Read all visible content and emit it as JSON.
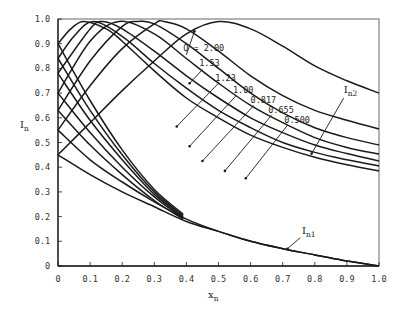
{
  "chart_data": {
    "type": "line",
    "title": "",
    "xlabel": "x_n",
    "ylabel": "I_n",
    "xlim": [
      0,
      1.0
    ],
    "ylim": [
      0,
      1.0
    ],
    "grid": false,
    "x_ticks": [
      "0",
      "0.1",
      "0.2",
      "0.3",
      "0.4",
      "0.5",
      "0.6",
      "0.7",
      "0.8",
      "0.9",
      "1.0"
    ],
    "y_ticks": [
      "0",
      "0.1",
      "0.2",
      "0.3",
      "0.4",
      "0.5",
      "0.6",
      "0.7",
      "0.8",
      "0.9",
      "1.0"
    ],
    "annotations": [
      {
        "text": "Q = 2.00",
        "x": 0.39,
        "y": 0.87
      },
      {
        "text": "1.53",
        "x": 0.44,
        "y": 0.81
      },
      {
        "text": "1.23",
        "x": 0.49,
        "y": 0.75
      },
      {
        "text": "1.00",
        "x": 0.545,
        "y": 0.7
      },
      {
        "text": "0.817",
        "x": 0.6,
        "y": 0.66
      },
      {
        "text": "0.655",
        "x": 0.655,
        "y": 0.62
      },
      {
        "text": "0.500",
        "x": 0.705,
        "y": 0.58
      },
      {
        "text": "I_n2",
        "x": 0.89,
        "y": 0.7
      },
      {
        "text": "I_n1",
        "x": 0.76,
        "y": 0.13
      }
    ],
    "series_In2": [
      {
        "name": "Q = 2.00",
        "x": [
          0,
          0.1,
          0.2,
          0.3,
          0.4,
          0.5,
          0.6,
          0.7,
          0.8,
          0.9,
          1.0
        ],
        "y": [
          0.45,
          0.58,
          0.71,
          0.83,
          0.94,
          0.99,
          0.96,
          0.89,
          0.81,
          0.75,
          0.7
        ]
      },
      {
        "name": "Q = 1.53",
        "x": [
          0,
          0.1,
          0.2,
          0.3,
          0.33,
          0.4,
          0.5,
          0.6,
          0.7,
          0.8,
          0.9,
          1.0
        ],
        "y": [
          0.55,
          0.73,
          0.88,
          0.98,
          0.99,
          0.96,
          0.87,
          0.77,
          0.69,
          0.63,
          0.59,
          0.555
        ]
      },
      {
        "name": "Q = 1.23",
        "x": [
          0,
          0.1,
          0.2,
          0.25,
          0.3,
          0.4,
          0.5,
          0.6,
          0.7,
          0.8,
          0.9,
          1.0
        ],
        "y": [
          0.63,
          0.83,
          0.97,
          0.99,
          0.98,
          0.9,
          0.8,
          0.7,
          0.62,
          0.56,
          0.52,
          0.49
        ]
      },
      {
        "name": "Q = 1.00",
        "x": [
          0,
          0.1,
          0.19,
          0.3,
          0.4,
          0.5,
          0.6,
          0.7,
          0.8,
          0.9,
          1.0
        ],
        "y": [
          0.7,
          0.91,
          0.99,
          0.94,
          0.84,
          0.74,
          0.65,
          0.58,
          0.52,
          0.48,
          0.453
        ]
      },
      {
        "name": "Q = 0.817",
        "x": [
          0,
          0.1,
          0.14,
          0.2,
          0.3,
          0.4,
          0.5,
          0.6,
          0.7,
          0.8,
          0.9,
          1.0
        ],
        "y": [
          0.78,
          0.96,
          0.99,
          0.96,
          0.87,
          0.77,
          0.68,
          0.6,
          0.54,
          0.49,
          0.455,
          0.425
        ]
      },
      {
        "name": "Q = 0.655",
        "x": [
          0,
          0.05,
          0.11,
          0.2,
          0.3,
          0.4,
          0.5,
          0.6,
          0.7,
          0.8,
          0.9,
          1.0
        ],
        "y": [
          0.84,
          0.93,
          0.99,
          0.93,
          0.82,
          0.72,
          0.63,
          0.56,
          0.5,
          0.46,
          0.43,
          0.405
        ]
      },
      {
        "name": "Q = 0.500",
        "x": [
          0,
          0.04,
          0.08,
          0.15,
          0.2,
          0.3,
          0.4,
          0.5,
          0.6,
          0.7,
          0.8,
          0.9,
          1.0
        ],
        "y": [
          0.9,
          0.96,
          0.99,
          0.96,
          0.91,
          0.79,
          0.68,
          0.6,
          0.53,
          0.48,
          0.44,
          0.41,
          0.385
        ]
      }
    ],
    "series_In1": [
      {
        "name": "Q = 0.500",
        "x": [
          0,
          0.1,
          0.2,
          0.3,
          0.39
        ],
        "y": [
          0.9,
          0.67,
          0.47,
          0.31,
          0.21
        ]
      },
      {
        "name": "Q = 0.655",
        "x": [
          0,
          0.1,
          0.2,
          0.3,
          0.39
        ],
        "y": [
          0.84,
          0.63,
          0.45,
          0.3,
          0.205
        ]
      },
      {
        "name": "Q = 0.817",
        "x": [
          0,
          0.1,
          0.2,
          0.3,
          0.39
        ],
        "y": [
          0.78,
          0.59,
          0.43,
          0.29,
          0.2
        ]
      },
      {
        "name": "Q = 1.00",
        "x": [
          0,
          0.1,
          0.2,
          0.3,
          0.39
        ],
        "y": [
          0.7,
          0.54,
          0.4,
          0.28,
          0.195
        ]
      },
      {
        "name": "Q = 1.23",
        "x": [
          0,
          0.1,
          0.2,
          0.3,
          0.39
        ],
        "y": [
          0.63,
          0.49,
          0.37,
          0.265,
          0.19
        ]
      },
      {
        "name": "Q = 1.53",
        "x": [
          0,
          0.1,
          0.2,
          0.3,
          0.4,
          0.5,
          0.6,
          0.7,
          0.8,
          0.9,
          1.0
        ],
        "y": [
          0.55,
          0.43,
          0.34,
          0.26,
          0.19,
          0.14,
          0.1,
          0.07,
          0.045,
          0.02,
          0.0
        ]
      },
      {
        "name": "Q = 2.00",
        "x": [
          0,
          0.1,
          0.2,
          0.3,
          0.4,
          0.5,
          0.6,
          0.7,
          0.8,
          0.9,
          1.0
        ],
        "y": [
          0.45,
          0.37,
          0.3,
          0.24,
          0.18,
          0.14,
          0.1,
          0.07,
          0.045,
          0.02,
          0.0
        ]
      }
    ],
    "leaders": [
      {
        "from": [
          0.4,
          0.855
        ],
        "to": [
          0.425,
          0.95
        ]
      },
      {
        "from": [
          0.45,
          0.795
        ],
        "to": [
          0.41,
          0.74
        ]
      },
      {
        "from": [
          0.5,
          0.74
        ],
        "to": [
          0.37,
          0.565
        ]
      },
      {
        "from": [
          0.555,
          0.69
        ],
        "to": [
          0.41,
          0.485
        ]
      },
      {
        "from": [
          0.61,
          0.65
        ],
        "to": [
          0.45,
          0.425
        ]
      },
      {
        "from": [
          0.665,
          0.61
        ],
        "to": [
          0.52,
          0.385
        ]
      },
      {
        "from": [
          0.715,
          0.57
        ],
        "to": [
          0.585,
          0.355
        ]
      },
      {
        "from": [
          0.89,
          0.68
        ],
        "to": [
          0.79,
          0.455
        ]
      },
      {
        "from": [
          0.755,
          0.115
        ],
        "to": [
          0.715,
          0.07
        ]
      }
    ]
  }
}
